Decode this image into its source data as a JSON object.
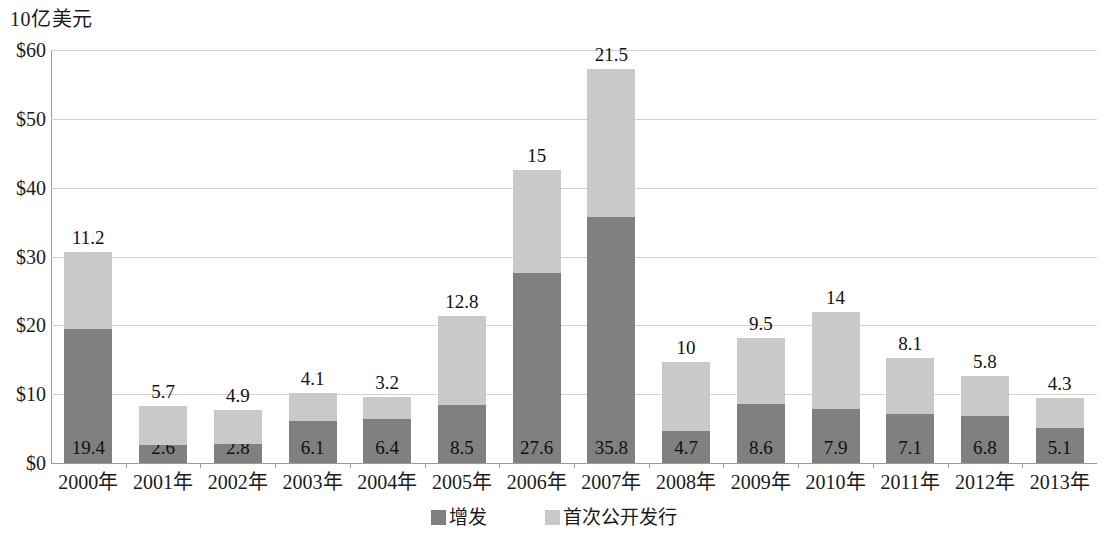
{
  "chart_data": {
    "type": "bar",
    "subtype": "stacked",
    "title": "",
    "ylabel": "10亿美元",
    "xlabel": "",
    "ylim": [
      0,
      60
    ],
    "ytick_labels": [
      "$0",
      "$10",
      "$20",
      "$30",
      "$40",
      "$50",
      "$60"
    ],
    "ytick_values": [
      0,
      10,
      20,
      30,
      40,
      50,
      60
    ],
    "grid": true,
    "legend_position": "bottom",
    "categories": [
      "2000年",
      "2001年",
      "2002年",
      "2003年",
      "2004年",
      "2005年",
      "2006年",
      "2007年",
      "2008年",
      "2009年",
      "2010年",
      "2011年",
      "2012年",
      "2013年"
    ],
    "series": [
      {
        "name": "增发",
        "color": "#808080",
        "values": [
          19.4,
          2.6,
          2.8,
          6.1,
          6.4,
          8.5,
          27.6,
          35.8,
          4.7,
          8.6,
          7.9,
          7.1,
          6.8,
          5.1
        ],
        "labels": [
          "19.4",
          "2.6",
          "2.8",
          "6.1",
          "6.4",
          "8.5",
          "27.6",
          "35.8",
          "4.7",
          "8.6",
          "7.9",
          "7.1",
          "6.8",
          "5.1"
        ]
      },
      {
        "name": "首次公开发行",
        "color": "#c9c9c9",
        "values": [
          11.2,
          5.7,
          4.9,
          4.1,
          3.2,
          12.8,
          15,
          21.5,
          10,
          9.5,
          14,
          8.1,
          5.8,
          4.3
        ],
        "labels": [
          "11.2",
          "5.7",
          "4.9",
          "4.1",
          "3.2",
          "12.8",
          "15",
          "21.5",
          "10",
          "9.5",
          "14",
          "8.1",
          "5.8",
          "4.3"
        ]
      }
    ],
    "totals": [
      30.6,
      8.3,
      7.7,
      10.2,
      9.6,
      21.3,
      42.6,
      57.3,
      14.7,
      18.1,
      21.9,
      15.2,
      12.6,
      9.4
    ]
  },
  "legend": {
    "entries": [
      {
        "label": "增发",
        "color": "#808080"
      },
      {
        "label": "首次公开发行",
        "color": "#c9c9c9"
      }
    ]
  },
  "colors": {
    "series_dark": "#808080",
    "series_light": "#c9c9c9",
    "gridline": "#d2d2d2",
    "axis": "#9a9a9a",
    "text": "#1a1a1a",
    "background": "#ffffff"
  }
}
